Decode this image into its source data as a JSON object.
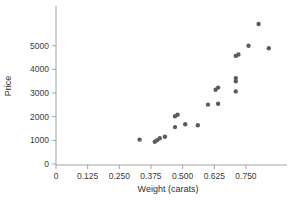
{
  "chart_data": {
    "type": "scatter",
    "title": "",
    "xlabel": "Weight (carats)",
    "ylabel": "Price",
    "x_tick_values": [
      0,
      0.125,
      0.25,
      0.375,
      0.5,
      0.625,
      0.75
    ],
    "x_tick_labels": [
      "0",
      "0.125",
      "0.250",
      "0.375",
      "0.500",
      "0.625",
      "0.750"
    ],
    "y_tick_values": [
      0,
      1000,
      2000,
      3000,
      4000,
      5000
    ],
    "y_tick_labels": [
      "0",
      "1000",
      "2000",
      "3000",
      "4000",
      "5000"
    ],
    "xlim": [
      0,
      0.912
    ],
    "ylim": [
      0,
      6680
    ],
    "grid": false,
    "legend": "none",
    "point_color": "#5c5c5c",
    "axis_color": "#a3a3a3",
    "point_radius": 2.2,
    "points": [
      {
        "x": 0.33,
        "y": 1030
      },
      {
        "x": 0.39,
        "y": 940
      },
      {
        "x": 0.4,
        "y": 1010
      },
      {
        "x": 0.41,
        "y": 1090
      },
      {
        "x": 0.43,
        "y": 1150
      },
      {
        "x": 0.47,
        "y": 1560
      },
      {
        "x": 0.47,
        "y": 2020
      },
      {
        "x": 0.48,
        "y": 2080
      },
      {
        "x": 0.51,
        "y": 1680
      },
      {
        "x": 0.56,
        "y": 1640
      },
      {
        "x": 0.6,
        "y": 2510
      },
      {
        "x": 0.64,
        "y": 2550
      },
      {
        "x": 0.63,
        "y": 3140
      },
      {
        "x": 0.64,
        "y": 3230
      },
      {
        "x": 0.71,
        "y": 3070
      },
      {
        "x": 0.71,
        "y": 3500
      },
      {
        "x": 0.71,
        "y": 3630
      },
      {
        "x": 0.71,
        "y": 4570
      },
      {
        "x": 0.72,
        "y": 4630
      },
      {
        "x": 0.76,
        "y": 5000
      },
      {
        "x": 0.8,
        "y": 5920
      },
      {
        "x": 0.84,
        "y": 4890
      }
    ]
  }
}
